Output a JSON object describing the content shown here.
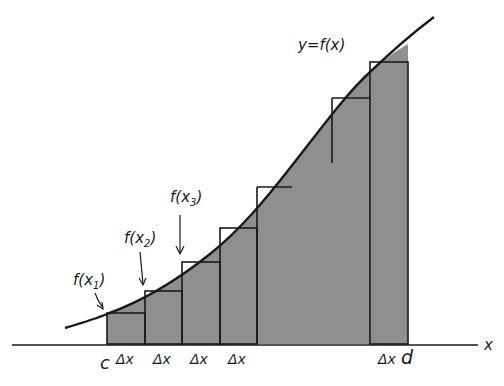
{
  "diagram": {
    "curve_label": "y=f(x)",
    "axis_label": "x",
    "left_bound_label": "c",
    "right_bound_label": "d",
    "delta_label": "Δx",
    "point_labels": [
      {
        "text": "f(x",
        "sub": "1",
        "close": ")"
      },
      {
        "text": "f(x",
        "sub": "2",
        "close": ")"
      },
      {
        "text": "f(x",
        "sub": "3",
        "close": ")"
      }
    ],
    "colors": {
      "fill": "#8f8f8f",
      "line": "#1a1a1a",
      "background": "#ffffff"
    }
  }
}
